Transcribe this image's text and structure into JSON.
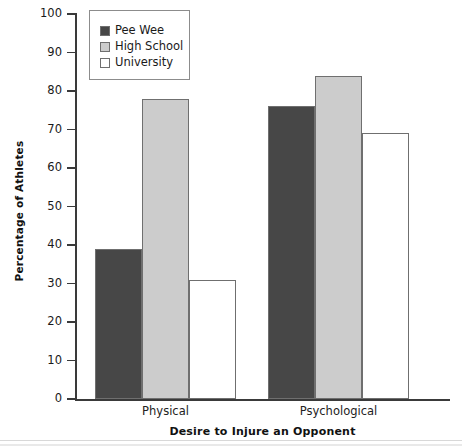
{
  "chart_data": {
    "type": "bar",
    "title": "",
    "xlabel": "Desire to Injure an Opponent",
    "ylabel": "Percentage of Athletes",
    "categories": [
      "Physical",
      "Psychological"
    ],
    "series": [
      {
        "name": "Pee Wee",
        "values": [
          39,
          76
        ],
        "color": "#474747"
      },
      {
        "name": "High School",
        "values": [
          78,
          84
        ],
        "color": "#cccccc"
      },
      {
        "name": "University",
        "values": [
          31,
          69
        ],
        "color": "#ffffff"
      }
    ],
    "ylim": [
      0,
      100
    ],
    "ytick_labels": [
      "0",
      "10",
      "20",
      "30",
      "40",
      "50",
      "60",
      "70",
      "80",
      "90",
      "100"
    ],
    "ytick_values": [
      0,
      10,
      20,
      30,
      40,
      50,
      60,
      70,
      80,
      90,
      100
    ],
    "grid": false,
    "legend_position": "top-left-inside",
    "axis_color": "#3a3a3a",
    "bar_border_color": "#6f6f6f"
  }
}
